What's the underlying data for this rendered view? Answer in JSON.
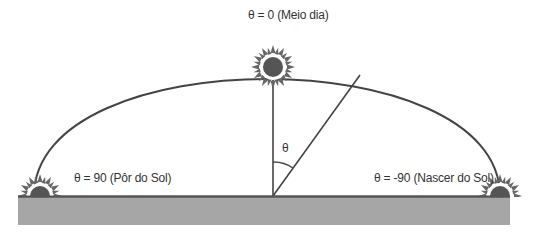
{
  "labels": {
    "noon": "θ = 0 (Meio dia)",
    "sunset": "θ = 90 (Pôr do Sol)",
    "sunrise": "θ = -90 (Nascer do Sol)",
    "angle": "θ"
  },
  "colors": {
    "ground": "#a6a6a6",
    "ground_edge": "#555555",
    "line": "#444444",
    "sun_core": "#555555",
    "sun_rays": "#666666",
    "sun_halo": "#ffffff",
    "text": "#333333"
  },
  "geometry": {
    "origin": [
      273,
      196
    ],
    "arc_left": [
      34,
      196
    ],
    "arc_right": [
      500,
      196
    ],
    "arc_top": [
      273,
      67
    ],
    "diagonal_end": [
      360,
      75
    ]
  }
}
